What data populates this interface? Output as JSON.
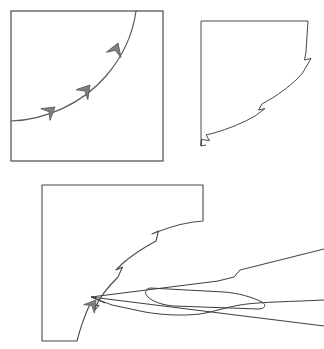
{
  "figure": {
    "title": "",
    "background_color": "#ffffff",
    "line_color": "#4a4a4a",
    "frame_color": "#4a4a4a",
    "marker_fill_color": "#808080",
    "marker_stroke_color": "#5a5a5a",
    "blade_color": "#3c3c3c",
    "width": 324,
    "height": 349,
    "panel_count": 3
  },
  "panels": [
    {
      "id": "panel-top-left",
      "label": "",
      "description": "square frame containing a concave curve with three arrow direction markers",
      "frame": {
        "x": 11,
        "y": 11,
        "width": 152,
        "height": 150
      },
      "frame_stroke_width": 1.2,
      "curve_stroke_width": 1.1,
      "curve_path": "M 11 121 C 45 120 82 104 106 76 C 124 55 133 33 136 11",
      "markers": [
        {
          "name": "arrow-marker-lower",
          "cx": 51,
          "cy": 110,
          "angle": -40,
          "scale": 1.0
        },
        {
          "name": "arrow-marker-middle",
          "cx": 86,
          "cy": 88,
          "angle": -52,
          "scale": 1.05
        },
        {
          "name": "arrow-marker-upper",
          "cx": 113,
          "cy": 48,
          "angle": -72,
          "scale": 1.05
        }
      ]
    },
    {
      "id": "panel-top-right",
      "label": "",
      "description": "square region trimmed by the curve, curve boundary carries three zigzag notches",
      "frame_outline_path": "M 201 21 L 308 21 L 306 53 L 305 62 L 310 60 L 303 74 L 300 79 L 292 86 L 276 97 L 262 105 L 256 111 L 260 114 L 249 119 L 243 122 L 230 127 L 216 131 L 206 135 L 210 139 L 202 139 L 201 145 Z",
      "frame_stroke_width": 1.0,
      "notches": [
        {
          "name": "notch-upper",
          "x": 305,
          "y": 62
        },
        {
          "name": "notch-middle",
          "x": 256,
          "y": 111
        },
        {
          "name": "notch-lower",
          "x": 206,
          "y": 135
        }
      ]
    },
    {
      "id": "panel-bottom",
      "label": "",
      "description": "L-shaped workpiece region with curved cut boundary, three zigzag notches, an arrow marker at the contact point, and a scalpel blade tool engaging the curve",
      "frame_outline_path": "M 42 185 L 203 185 L 203 222 C 170 227 140 241 120 259 C 104 273 95 285 91 298 L 91 298 C 86 311 80 326 77 341 L 42 341 Z",
      "frame_stroke_width": 1.1,
      "curve_path": "M 203 222 C 170 227 140 241 120 259 C 104 273 95 286 91 298 C 86 312 80 327 77 341",
      "notches": [
        {
          "name": "notch-upper",
          "x": 156,
          "y": 236
        },
        {
          "name": "notch-middle",
          "x": 116,
          "y": 262
        },
        {
          "name": "notch-lower",
          "x": 95,
          "y": 303
        }
      ],
      "contact_marker": {
        "name": "arrow-marker-contact",
        "cx": 95,
        "cy": 299,
        "angle": -58,
        "scale": 1.0
      },
      "tool": {
        "name": "scalpel-blade",
        "tip_x": 92,
        "tip_y": 297,
        "outline_path": "M 92 297 L 215 281 L 236 276 L 238 271 L 324 250 M 92 297 L 324 327 M 92 297 L 110 304 L 140 311 L 180 315 L 218 314 L 252 310 L 286 306 L 324 301",
        "slot_path": "M 146 296 C 143 293 143 289 147 288 L 226 293 C 238 294 252 298 262 303 C 266 306 264 310 258 310 L 170 306 C 158 305 150 301 146 296 Z"
      }
    }
  ],
  "legend": {
    "visible": false,
    "entries": []
  },
  "annotations": []
}
